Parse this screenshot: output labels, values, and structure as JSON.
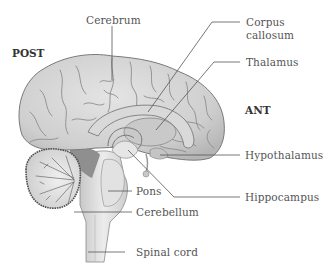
{
  "diagram": {
    "type": "anatomical-illustration",
    "orientation": {
      "posterior_label": "POST",
      "anterior_label": "ANT"
    },
    "labels": [
      {
        "id": "cerebrum",
        "text": "Cerebrum"
      },
      {
        "id": "corpus-callosum",
        "text_line1": "Corpus",
        "text_line2": "callosum"
      },
      {
        "id": "thalamus",
        "text": "Thalamus"
      },
      {
        "id": "hypothalamus",
        "text": "Hypothalamus"
      },
      {
        "id": "hippocampus",
        "text": "Hippocampus"
      },
      {
        "id": "pons",
        "text": "Pons"
      },
      {
        "id": "cerebellum",
        "text": "Cerebellum"
      },
      {
        "id": "spinal-cord",
        "text": "Spinal cord"
      }
    ],
    "colors": {
      "background": "#ffffff",
      "brain_fill": "#d6d6d6",
      "brain_outline": "#7a7a7a",
      "sulci": "#8c8c8c",
      "cerebellum_outline": "#555555",
      "brainstem_fill": "#e0e0e0",
      "ventricle_fill": "#9a9a9a",
      "leader_lines": "#555555",
      "label_text": "#555555",
      "direction_text": "#333333"
    }
  }
}
